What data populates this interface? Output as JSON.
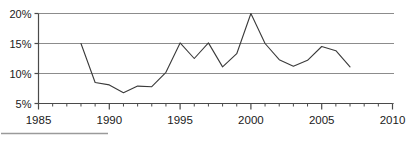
{
  "chart_data": {
    "type": "line",
    "title": "",
    "subtitle": "",
    "xlabel": "",
    "ylabel": "",
    "xlim": [
      1985,
      2010
    ],
    "ylim": [
      5,
      20
    ],
    "grid": true,
    "grid_axis": "y",
    "legend": false,
    "legend_position": "none",
    "y_ticks": [
      5,
      10,
      15,
      20
    ],
    "y_tick_labels": [
      "5%",
      "10%",
      "15%",
      "20%"
    ],
    "x_ticks": [
      1985,
      1990,
      1995,
      2000,
      2005,
      2010
    ],
    "x_tick_labels": [
      "1985",
      "1990",
      "1995",
      "2000",
      "2005",
      "2010"
    ],
    "x_minor_tick_step": 1,
    "x": [
      1988,
      1989,
      1990,
      1991,
      1992,
      1993,
      1994,
      1995,
      1996,
      1997,
      1998,
      1999,
      2000,
      2001,
      2002,
      2003,
      2004,
      2005,
      2006,
      2007
    ],
    "values": [
      15.0,
      8.5,
      8.1,
      6.8,
      7.9,
      7.8,
      10.2,
      15.1,
      12.5,
      15.1,
      11.1,
      13.3,
      20.0,
      15.0,
      12.3,
      11.2,
      12.2,
      14.5,
      13.8,
      11.1
    ],
    "series": [
      {
        "name": "series-1",
        "color": "#3a3a3a",
        "values": [
          15.0,
          8.5,
          8.1,
          6.8,
          7.9,
          7.8,
          10.2,
          15.1,
          12.5,
          15.1,
          11.1,
          13.3,
          20.0,
          15.0,
          12.3,
          11.2,
          12.2,
          14.5,
          13.8,
          11.1
        ]
      }
    ]
  },
  "colors": {
    "line": "#3a3a3a",
    "grid": "#8c8c8c",
    "axis": "#4a4a4a",
    "text": "#1a1a1a",
    "footer_rule": "#9a9a9a"
  },
  "footer": {
    "rule_label": "horizontal-rule"
  }
}
